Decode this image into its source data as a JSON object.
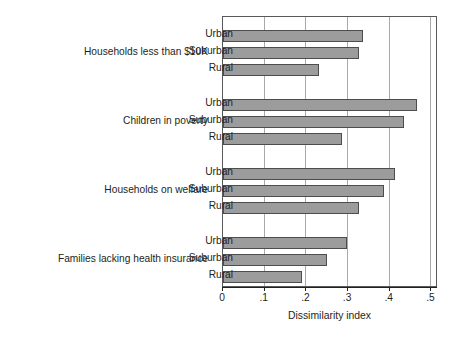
{
  "chart_data": {
    "type": "bar",
    "orientation": "horizontal",
    "title": "",
    "xlabel": "Dissimilarity index",
    "ylabel": "",
    "xlim": [
      0,
      0.5156
    ],
    "xticks": [
      0,
      0.1,
      0.2,
      0.3,
      0.4,
      0.5
    ],
    "xticklabels": [
      "0",
      ".1",
      ".2",
      ".3",
      ".4",
      ".5"
    ],
    "grid": "vertical",
    "legend": "none",
    "categories": [
      "Households less than $10K",
      "Children in poverty",
      "Households on welfare",
      "Families lacking health insurance"
    ],
    "subcategories": [
      "Urban",
      "Suburban",
      "Rural"
    ],
    "groups": [
      {
        "label": "Households less than $10K",
        "bars": [
          {
            "label": "Urban",
            "value": 0.336
          },
          {
            "label": "Suburban",
            "value": 0.326
          },
          {
            "label": "Rural",
            "value": 0.23
          }
        ]
      },
      {
        "label": "Children in poverty",
        "bars": [
          {
            "label": "Urban",
            "value": 0.465
          },
          {
            "label": "Suburban",
            "value": 0.434
          },
          {
            "label": "Rural",
            "value": 0.285
          }
        ]
      },
      {
        "label": "Households on welfare",
        "bars": [
          {
            "label": "Urban",
            "value": 0.413
          },
          {
            "label": "Suburban",
            "value": 0.386
          },
          {
            "label": "Rural",
            "value": 0.326
          }
        ]
      },
      {
        "label": "Families lacking health insurance",
        "bars": [
          {
            "label": "Urban",
            "value": 0.297
          },
          {
            "label": "Suburban",
            "value": 0.249
          },
          {
            "label": "Rural",
            "value": 0.189
          }
        ]
      }
    ],
    "colors": {
      "bar_fill": "#9c9c9c",
      "bar_border": "#4d4d4d",
      "gridline": "#a7a9ac",
      "axis": "#231f20",
      "text": "#231f20",
      "background": "#ffffff"
    }
  }
}
